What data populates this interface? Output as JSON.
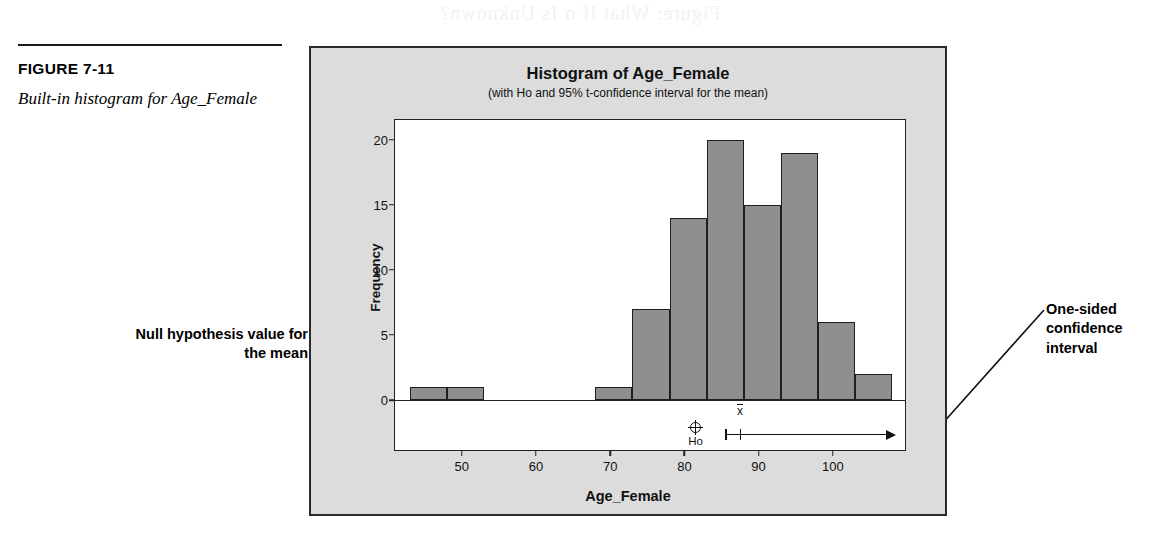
{
  "bleed_through": {
    "text": "Figure: What If σ Is Unknown?"
  },
  "caption": {
    "figure_number": "FIGURE 7-11",
    "description": "Built-in histogram for Age_Female"
  },
  "annotations": {
    "null_hypothesis": "Null hypothesis value for the mean",
    "one_sided": "One-sided confidence interval"
  },
  "chart_data": {
    "type": "bar",
    "title": "Histogram of Age_Female",
    "subtitle": "(with Ho and 95% t-confidence interval for the mean)",
    "xlabel": "Age_Female",
    "ylabel": "Frequency",
    "xlim": [
      41,
      110
    ],
    "ylim": [
      0,
      21.5
    ],
    "grid": false,
    "legend": null,
    "bin_width": 5,
    "bin_starts": [
      43,
      48,
      53,
      58,
      63,
      68,
      73,
      78,
      83,
      88,
      93,
      98,
      103
    ],
    "categories": [
      "43-48",
      "48-53",
      "53-58",
      "58-63",
      "63-68",
      "68-73",
      "73-78",
      "78-83",
      "83-88",
      "88-93",
      "93-98",
      "98-103",
      "103-108"
    ],
    "values": [
      1,
      1,
      0,
      0,
      0,
      1,
      7,
      14,
      20,
      15,
      19,
      6,
      2
    ],
    "xticks": [
      50,
      60,
      70,
      80,
      90,
      100
    ],
    "xtick_labels": [
      "50",
      "60",
      "70",
      "80",
      "90",
      "100"
    ],
    "yticks": [
      0,
      5,
      10,
      15,
      20
    ],
    "ytick_labels": [
      "0",
      "5",
      "10",
      "15",
      "20"
    ],
    "annotations": {
      "ho_label": "Ho",
      "ho_value": 81.5,
      "mean_label": "x",
      "mean_value": 87.5,
      "ci_lower": 85.5,
      "ci_upper": 107.5,
      "ci_type": "one-sided"
    },
    "colors": {
      "bar_fill": "#8f8f8f",
      "bar_edge": "#1f1f1f",
      "panel_background": "#dcdcdc",
      "plot_background": "#ffffff",
      "axis": "#222222"
    }
  }
}
